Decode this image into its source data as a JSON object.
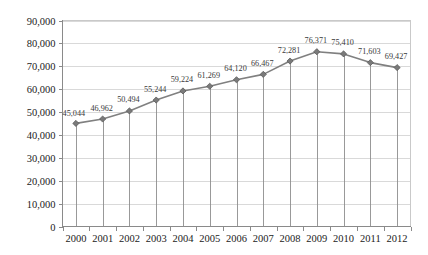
{
  "chart_data": {
    "type": "line",
    "title": "",
    "subtitle": "",
    "xlabel": "",
    "ylabel": "",
    "categories": [
      "2000",
      "2001",
      "2002",
      "2003",
      "2004",
      "2005",
      "2006",
      "2007",
      "2008",
      "2009",
      "2010",
      "2011",
      "2012"
    ],
    "values": [
      45044,
      46962,
      50494,
      55244,
      59224,
      61269,
      64120,
      66467,
      72281,
      76371,
      75410,
      71603,
      69427
    ],
    "data_labels": [
      "45,044",
      "46,962",
      "50,494",
      "55,244",
      "59,224",
      "61,269",
      "64,120",
      "66,467",
      "72,281",
      "76,371",
      "75,410",
      "71,603",
      "69,427"
    ],
    "ylim": [
      0,
      90000
    ],
    "ytick_values": [
      0,
      10000,
      20000,
      30000,
      40000,
      50000,
      60000,
      70000,
      80000,
      90000
    ],
    "ytick_labels": [
      "0",
      "10,000",
      "20,000",
      "30,000",
      "40,000",
      "50,000",
      "60,000",
      "70,000",
      "80,000",
      "90,000"
    ],
    "grid": true,
    "grid_axis": "y",
    "legend": false,
    "legend_position": "none",
    "marker": "diamond",
    "drop_lines": true,
    "colors": {
      "line": "#808080",
      "marker_fill": "#7a7a7a",
      "marker_stroke": "#555555",
      "gridline": "#d9d9d9",
      "axis": "#8a8a8a",
      "plot_border": "#c9c9c9",
      "label_text": "#3a3a3a",
      "tick_text": "#222222",
      "background": "#ffffff"
    }
  }
}
